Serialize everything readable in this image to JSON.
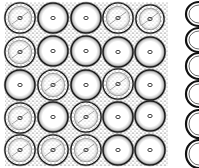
{
  "figure": {
    "colors": {
      "ink": "#111111",
      "paper": "#ffffff",
      "stipple": "#555555"
    },
    "main_panel": {
      "x": 6,
      "y": 2,
      "width": 162,
      "height": 164,
      "rows": 5,
      "cols": 5,
      "cells": [
        {
          "cx": 20,
          "cy": 18,
          "r": 15,
          "type": "textured"
        },
        {
          "cx": 53,
          "cy": 18,
          "r": 15,
          "type": "clear"
        },
        {
          "cx": 86,
          "cy": 18,
          "r": 15,
          "type": "clear"
        },
        {
          "cx": 118,
          "cy": 18,
          "r": 15,
          "type": "textured"
        },
        {
          "cx": 150,
          "cy": 19,
          "r": 14,
          "type": "textured"
        },
        {
          "cx": 20,
          "cy": 52,
          "r": 15,
          "type": "textured"
        },
        {
          "cx": 53,
          "cy": 51,
          "r": 15,
          "type": "clear"
        },
        {
          "cx": 86,
          "cy": 51,
          "r": 15,
          "type": "clear"
        },
        {
          "cx": 118,
          "cy": 52,
          "r": 15,
          "type": "clear"
        },
        {
          "cx": 150,
          "cy": 52,
          "r": 15,
          "type": "clear"
        },
        {
          "cx": 20,
          "cy": 85,
          "r": 15,
          "type": "clear"
        },
        {
          "cx": 53,
          "cy": 85,
          "r": 15,
          "type": "textured"
        },
        {
          "cx": 86,
          "cy": 85,
          "r": 15,
          "type": "clear"
        },
        {
          "cx": 118,
          "cy": 84,
          "r": 15,
          "type": "textured"
        },
        {
          "cx": 150,
          "cy": 85,
          "r": 15,
          "type": "clear"
        },
        {
          "cx": 20,
          "cy": 118,
          "r": 15,
          "type": "textured"
        },
        {
          "cx": 53,
          "cy": 117,
          "r": 15,
          "type": "clear"
        },
        {
          "cx": 86,
          "cy": 117,
          "r": 15,
          "type": "textured"
        },
        {
          "cx": 118,
          "cy": 117,
          "r": 15,
          "type": "clear"
        },
        {
          "cx": 150,
          "cy": 116,
          "r": 15,
          "type": "clear"
        },
        {
          "cx": 20,
          "cy": 150,
          "r": 15,
          "type": "textured"
        },
        {
          "cx": 53,
          "cy": 150,
          "r": 15,
          "type": "textured"
        },
        {
          "cx": 86,
          "cy": 150,
          "r": 15,
          "type": "textured"
        },
        {
          "cx": 118,
          "cy": 150,
          "r": 15,
          "type": "clear"
        },
        {
          "cx": 150,
          "cy": 150,
          "r": 15,
          "type": "clear"
        }
      ]
    },
    "side_panel": {
      "x": 185,
      "y": 0,
      "width": 14,
      "height": 168,
      "rings": [
        {
          "cy": 14,
          "ry": 12
        },
        {
          "cy": 40,
          "ry": 12
        },
        {
          "cy": 66,
          "ry": 13
        },
        {
          "cy": 94,
          "ry": 13
        },
        {
          "cy": 124,
          "ry": 14
        },
        {
          "cy": 154,
          "ry": 14
        }
      ]
    }
  }
}
